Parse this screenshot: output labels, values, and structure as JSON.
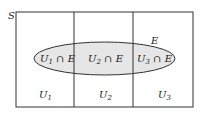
{
  "diagram": {
    "sample_space_label": "S",
    "event_label": "E",
    "partitions": [
      {
        "label": "U1",
        "base": "U",
        "sub": "1",
        "intersection": "U1 ∩ E"
      },
      {
        "label": "U2",
        "base": "U",
        "sub": "2",
        "intersection": "U2 ∩ E"
      },
      {
        "label": "U3",
        "base": "U",
        "sub": "3",
        "intersection": "U3 ∩ E"
      }
    ],
    "intersection_symbol": "∩",
    "colors": {
      "stroke": "#333333",
      "ellipse_fill": "#e6e6e6",
      "background": "#ffffff"
    }
  }
}
